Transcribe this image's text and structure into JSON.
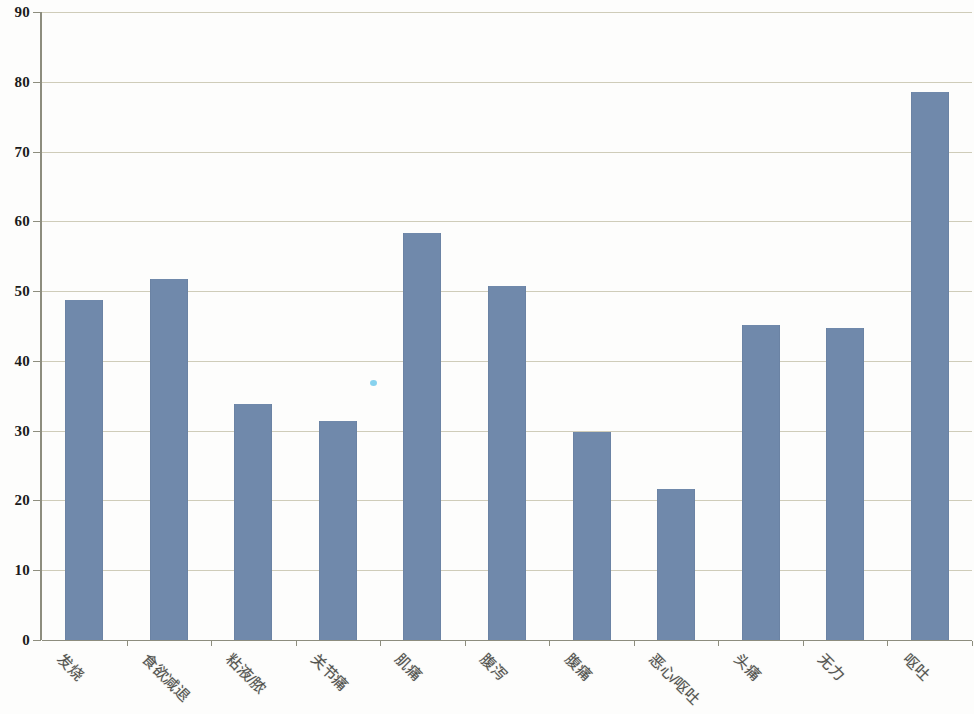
{
  "chart_data": {
    "type": "bar",
    "title": "",
    "subtitle": "",
    "xlabel": "",
    "ylabel": "",
    "ylim": [
      0,
      90
    ],
    "ytick_step": 10,
    "yticks": [
      0,
      10,
      20,
      30,
      40,
      50,
      60,
      70,
      80,
      90
    ],
    "ytick_labels": [
      "0",
      "10",
      "20",
      "30",
      "40",
      "50",
      "60",
      "70",
      "80",
      "90"
    ],
    "grid": "horizontal",
    "legend": "none",
    "categories": [
      "发烧",
      "食欲减退",
      "粘液/脓",
      "关节痛",
      "肌痛",
      "腹泻",
      "腹痛",
      "恶心/呕吐",
      "头痛",
      "无力",
      "呕吐"
    ],
    "values": [
      48.7,
      51.8,
      33.8,
      31.4,
      58.4,
      50.7,
      29.8,
      21.6,
      45.1,
      44.7,
      78.5
    ],
    "bar_color": "#7089ab",
    "gridline_color": "#cfccb9",
    "axis_color": "#8d8d7e",
    "plot_background": "#ffffff"
  }
}
